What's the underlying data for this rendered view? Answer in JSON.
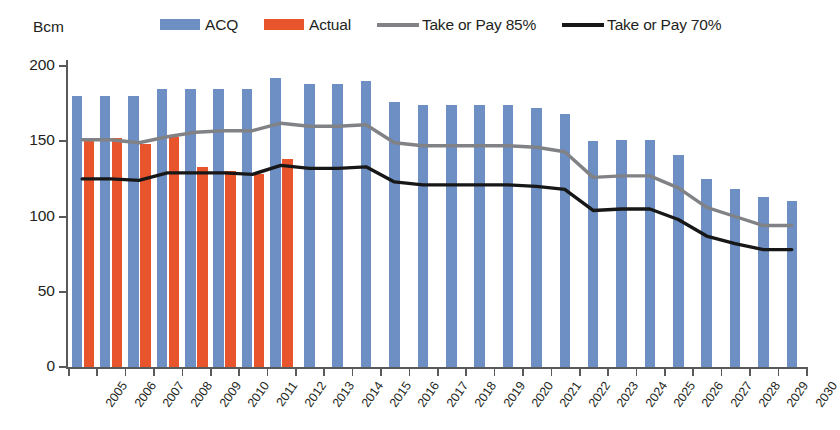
{
  "axis_unit": "Bcm",
  "legend": [
    {
      "label": "ACQ",
      "kind": "swatch",
      "color": "#6d8fc4"
    },
    {
      "label": "Actual",
      "kind": "swatch",
      "color": "#e8552d"
    },
    {
      "label": "Take or Pay 85%",
      "kind": "line",
      "color": "#808285"
    },
    {
      "label": "Take or Pay 70%",
      "kind": "line",
      "color": "#171717"
    }
  ],
  "colors": {
    "acq": "#6d8fc4",
    "actual": "#e8552d",
    "top85": "#808285",
    "top70": "#171717",
    "axis": "#58595b",
    "text": "#231f20",
    "background": "#ffffff"
  },
  "chart_data": {
    "type": "bar",
    "title": "",
    "subtitle": "",
    "xlabel": "",
    "ylabel": "Bcm",
    "ylim": [
      0,
      200
    ],
    "yticks": [
      0,
      50,
      100,
      150,
      200
    ],
    "grid": false,
    "legend_position": "top",
    "categories": [
      "2005",
      "2006",
      "2007",
      "2008",
      "2009",
      "2010",
      "2011",
      "2012",
      "2013",
      "2014",
      "2015",
      "2016",
      "2017",
      "2018",
      "2019",
      "2020",
      "2021",
      "2022",
      "2023",
      "2024",
      "2025",
      "2026",
      "2027",
      "2028",
      "2029",
      "2030"
    ],
    "series": [
      {
        "name": "ACQ",
        "type": "bar",
        "color": "#6d8fc4",
        "values": [
          180,
          180,
          180,
          185,
          185,
          185,
          185,
          192,
          188,
          188,
          190,
          176,
          174,
          174,
          174,
          174,
          172,
          168,
          150,
          151,
          151,
          141,
          125,
          118,
          113,
          110
        ]
      },
      {
        "name": "Actual",
        "type": "bar",
        "color": "#e8552d",
        "values": [
          152,
          152,
          148,
          153,
          133,
          130,
          128,
          138,
          null,
          null,
          null,
          null,
          null,
          null,
          null,
          null,
          null,
          null,
          null,
          null,
          null,
          null,
          null,
          null,
          null,
          null
        ]
      },
      {
        "name": "Take or Pay 85%",
        "type": "line",
        "color": "#808285",
        "values": [
          151,
          151,
          149,
          153,
          156,
          157,
          157,
          162,
          160,
          160,
          161,
          149,
          147,
          147,
          147,
          147,
          146,
          143,
          126,
          127,
          127,
          119,
          106,
          100,
          94,
          94
        ]
      },
      {
        "name": "Take or Pay 70%",
        "type": "line",
        "color": "#171717",
        "values": [
          125,
          125,
          124,
          129,
          129,
          129,
          128,
          134,
          132,
          132,
          133,
          123,
          121,
          121,
          121,
          121,
          120,
          118,
          104,
          105,
          105,
          98,
          87,
          82,
          78,
          78
        ]
      }
    ]
  }
}
